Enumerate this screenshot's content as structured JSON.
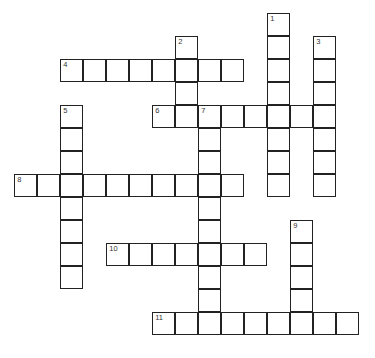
{
  "puzzle": {
    "type": "crossword",
    "grid_origin": {
      "x": 15,
      "y": 14
    },
    "cell_size": 23,
    "entries": [
      {
        "number": "1",
        "direction": "down",
        "row": 0,
        "col": 11,
        "length": 8
      },
      {
        "number": "2",
        "direction": "down",
        "row": 1,
        "col": 7,
        "length": 4
      },
      {
        "number": "3",
        "direction": "down",
        "row": 1,
        "col": 13,
        "length": 7
      },
      {
        "number": "4",
        "direction": "across",
        "row": 2,
        "col": 2,
        "length": 8
      },
      {
        "number": "5",
        "direction": "down",
        "row": 4,
        "col": 2,
        "length": 8
      },
      {
        "number": "6",
        "direction": "across",
        "row": 4,
        "col": 6,
        "length": 8
      },
      {
        "number": "7",
        "direction": "down",
        "row": 4,
        "col": 8,
        "length": 9
      },
      {
        "number": "8",
        "direction": "across",
        "row": 7,
        "col": 0,
        "length": 10
      },
      {
        "number": "9",
        "direction": "down",
        "row": 9,
        "col": 12,
        "length": 5
      },
      {
        "number": "10",
        "direction": "across",
        "row": 10,
        "col": 4,
        "length": 7
      },
      {
        "number": "11",
        "direction": "across",
        "row": 13,
        "col": 6,
        "length": 9
      }
    ]
  }
}
